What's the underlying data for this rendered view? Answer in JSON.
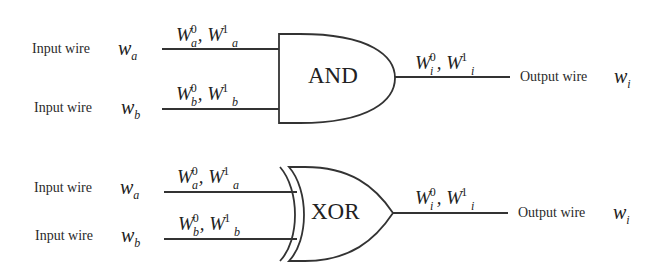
{
  "gates": [
    {
      "type_label": "AND",
      "inputs": [
        {
          "label": "Input wire",
          "wire": "w",
          "wire_sub": "a",
          "keys": {
            "base": "W",
            "sub": "a",
            "sup0": "0",
            "sup1": "1"
          }
        },
        {
          "label": "Input wire",
          "wire": "w",
          "wire_sub": "b",
          "keys": {
            "base": "W",
            "sub": "b",
            "sup0": "0",
            "sup1": "1"
          }
        }
      ],
      "output": {
        "label": "Output wire",
        "wire": "w",
        "wire_sub": "i",
        "keys": {
          "base": "W",
          "sub": "i",
          "sup0": "0",
          "sup1": "1"
        }
      }
    },
    {
      "type_label": "XOR",
      "inputs": [
        {
          "label": "Input wire",
          "wire": "w",
          "wire_sub": "a",
          "keys": {
            "base": "W",
            "sub": "a",
            "sup0": "0",
            "sup1": "1"
          }
        },
        {
          "label": "Input wire",
          "wire": "w",
          "wire_sub": "b",
          "keys": {
            "base": "W",
            "sub": "b",
            "sup0": "0",
            "sup1": "1"
          }
        }
      ],
      "output": {
        "label": "Output wire",
        "wire": "w",
        "wire_sub": "i",
        "keys": {
          "base": "W",
          "sub": "i",
          "sup0": "0",
          "sup1": "1"
        }
      }
    }
  ],
  "separator": ","
}
